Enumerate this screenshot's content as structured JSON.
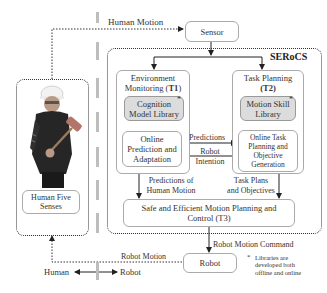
{
  "diagram": {
    "system_name": "SERoCS",
    "nodes": {
      "sensor": "Sensor",
      "t1_title_a": "Environment",
      "t1_title_b": "Monitoring (",
      "t1_code": "T1",
      "t1_close": ")",
      "cognition_library": "Cognition Model Library",
      "cognition_library_a": "Cognition",
      "cognition_library_b": "Model Library",
      "online_prediction_a": "Online",
      "online_prediction_b": "Prediction and",
      "online_prediction_c": "Adaptation",
      "t2_title_a": "Task Planning",
      "t2_code": "(T2)",
      "motion_skill_a": "Motion Skill",
      "motion_skill_b": "Library",
      "online_task_a": "Online Task",
      "online_task_b": "Planning and",
      "online_task_c": "Objective",
      "online_task_d": "Generation",
      "t3_line1": "Safe and Efficient Motion Planning and",
      "t3_line2": "Control (T3)",
      "robot": "Robot",
      "human_senses_a": "Human Five",
      "human_senses_b": "Senses"
    },
    "edges": {
      "human_motion": "Human Motion",
      "predictions": "Predictions",
      "robot_intention_a": "Robot",
      "robot_intention_b": "Intention",
      "predictions_human_a": "Predictions of",
      "predictions_human_b": "Human Motion",
      "task_plans_a": "Task Plans",
      "task_plans_b": "and Objectives",
      "robot_motion_command": "Robot Motion Command",
      "robot_motion": "Robot Motion"
    },
    "legend": {
      "human": "Human",
      "robot": "Robot",
      "asterisk": "*",
      "note_a": "Libraries are",
      "note_b": "developed both",
      "note_c": "offline and online"
    }
  }
}
